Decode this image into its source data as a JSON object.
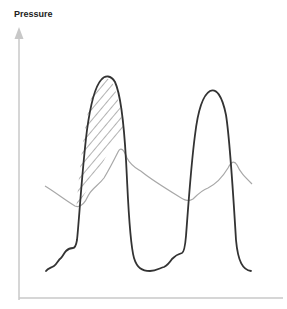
{
  "diagram": {
    "y_axis_label": "Pressure",
    "colors": {
      "axis": "#c8c8c8",
      "primary_curve": "#333333",
      "secondary_curve": "#a8a8a8",
      "hatch": "#555555",
      "label": "#222222"
    },
    "curves": [
      {
        "name": "primary-pressure-curve",
        "description": "dark curve with two tall peaks"
      },
      {
        "name": "secondary-pressure-curve",
        "description": "light grey undulating curve with small humps"
      }
    ],
    "hatched_region": "area between primary and secondary curve on the first peak"
  }
}
